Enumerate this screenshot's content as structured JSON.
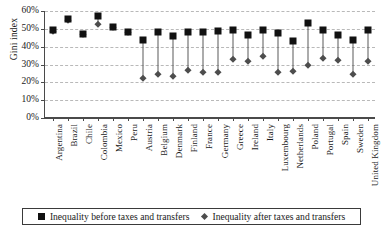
{
  "chart_data": {
    "type": "scatter",
    "title": "",
    "xlabel": "",
    "ylabel": "Gini index",
    "ylim": [
      0,
      60
    ],
    "ytick_labels": [
      "60%",
      "50%",
      "40%",
      "30%",
      "20%",
      "10%",
      "0%"
    ],
    "ytick_values": [
      60,
      50,
      40,
      30,
      20,
      10,
      0
    ],
    "grid": true,
    "legend_position": "bottom",
    "categories": [
      "Argentina",
      "Brazil",
      "Chile",
      "Colombia",
      "Mexico",
      "Peru",
      "Austria",
      "Belgium",
      "Denmark",
      "Finland",
      "France",
      "Germany",
      "Greece",
      "Ireland",
      "Italy",
      "Luxembourg",
      "Netherlands",
      "Poland",
      "Portugal",
      "Spain",
      "Sweden",
      "United Kingdom"
    ],
    "series": [
      {
        "name": "Inequality before taxes and transfers",
        "marker": "square",
        "color": "#111111",
        "values": [
          49.5,
          55.5,
          47.0,
          57.0,
          51.0,
          48.5,
          44.0,
          48.5,
          46.0,
          48.5,
          48.5,
          49.0,
          49.5,
          46.5,
          49.5,
          47.5,
          43.0,
          53.0,
          49.5,
          46.5,
          44.0,
          49.5
        ]
      },
      {
        "name": "Inequality after taxes and transfers",
        "marker": "diamond",
        "color": "#4d4d4d",
        "values": [
          49.0,
          55.0,
          47.0,
          52.5,
          51.0,
          48.5,
          22.5,
          24.8,
          23.3,
          27.0,
          26.0,
          26.0,
          33.0,
          32.0,
          34.5,
          26.0,
          26.5,
          30.0,
          33.5,
          32.5,
          24.5,
          32.0
        ]
      }
    ]
  },
  "legend": {
    "items": [
      {
        "label": "Inequality before taxes and transfers",
        "marker": "square-marker-icon"
      },
      {
        "label": "Inequality after taxes and transfers",
        "marker": "diamond-marker-icon"
      }
    ]
  }
}
